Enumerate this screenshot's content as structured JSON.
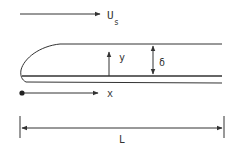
{
  "diagram": {
    "free_stream": {
      "label_main": "U",
      "label_sub": "s"
    },
    "axes": {
      "x_label": "x",
      "y_label": "y"
    },
    "thickness": {
      "label": "δ"
    },
    "length": {
      "label": "L"
    },
    "colors": {
      "stroke": "#333333",
      "background": "#ffffff"
    }
  }
}
